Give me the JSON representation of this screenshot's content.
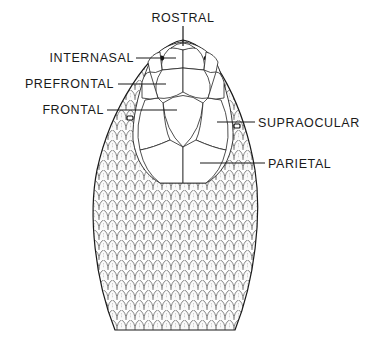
{
  "diagram": {
    "labels": [
      {
        "id": "rostral",
        "text": "ROSTRAL"
      },
      {
        "id": "internasal",
        "text": "INTERNASAL"
      },
      {
        "id": "prefrontal",
        "text": "PREFRONTAL"
      },
      {
        "id": "frontal",
        "text": "FRONTAL"
      },
      {
        "id": "supraocular",
        "text": "SUPRAOCULAR"
      },
      {
        "id": "parietal",
        "text": "PARIETAL"
      }
    ]
  },
  "colors": {
    "ink": "#1a1a1a",
    "background": "#ffffff"
  }
}
